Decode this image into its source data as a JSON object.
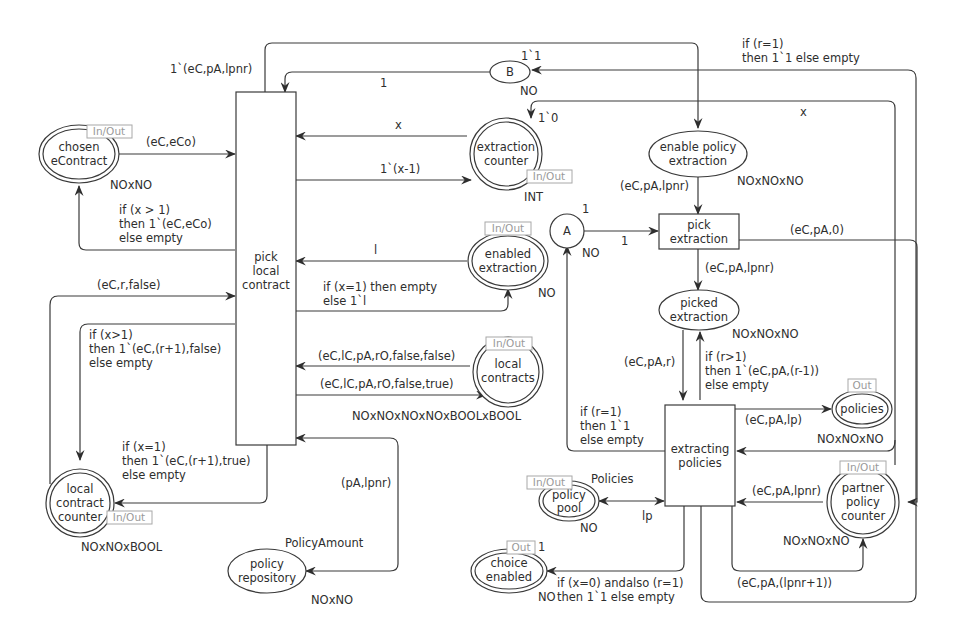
{
  "places": {
    "chosen_econtract": {
      "label1": "chosen",
      "label2": "eContract",
      "port": "In/Out",
      "type": "NOxNO"
    },
    "extraction_counter": {
      "label1": "extraction",
      "label2": "counter",
      "port": "In/Out",
      "type": "INT",
      "init": "1`0"
    },
    "enabled_extraction": {
      "label1": "enabled",
      "label2": "extraction",
      "port": "In/Out",
      "type": "NO"
    },
    "local_contracts": {
      "label1": "local",
      "label2": "contracts",
      "port": "In/Out",
      "type": "NOxNOxNOxNOxBOOLxBOOL"
    },
    "local_contract_counter": {
      "label1": "local",
      "label2": "contract",
      "label3": "counter",
      "port": "In/Out",
      "type": "NOxNOxBOOL"
    },
    "policy_repository": {
      "label1": "policy",
      "label2": "repository",
      "fusion": "PolicyAmount",
      "type": "NOxNO"
    },
    "b": {
      "label": "B",
      "type": "NO",
      "init": "1`1"
    },
    "a": {
      "label": "A",
      "type": "NO",
      "init": "1"
    },
    "enable_policy_extraction": {
      "label1": "enable policy",
      "label2": "extraction",
      "type": "NOxNOxNO"
    },
    "picked_extraction": {
      "label1": "picked",
      "label2": "extraction",
      "type": "NOxNOxNO"
    },
    "policies": {
      "label": "policies",
      "port": "Out",
      "type": "NOxNOxNO"
    },
    "policy_pool": {
      "label1": "policy",
      "label2": "pool",
      "port": "In/Out",
      "fusion": "Policies",
      "type": "NO"
    },
    "partner_policy_counter": {
      "label1": "partner",
      "label2": "policy",
      "label3": "counter",
      "port": "In/Out",
      "type": "NOxNOxNO"
    },
    "choice_enabled": {
      "label1": "choice",
      "label2": "enabled",
      "port": "Out",
      "type": "NO",
      "init": "1"
    }
  },
  "transitions": {
    "pick_local_contract": {
      "label1": "pick",
      "label2": "local",
      "label3": "contract"
    },
    "pick_extraction": {
      "label1": "pick",
      "label2": "extraction"
    },
    "extracting_policies": {
      "label1": "extracting",
      "label2": "policies"
    }
  },
  "arcs": {
    "top_out": "1`(eC,pA,lpnr)",
    "b_to_pick": "1",
    "chosen_to_pick": "(eC,eCo)",
    "pick_to_chosen": [
      "if (x > 1)",
      "then 1`(eC,eCo)",
      "else empty"
    ],
    "counter_to_pick": "x",
    "pick_to_counter": "1`(x-1)",
    "enabled_to_pick": "l",
    "pick_to_enabled": [
      "if (x=1) then empty",
      "else 1`l"
    ],
    "lcc_to_pick": "(eC,r,false)",
    "pick_to_lcc_false": [
      "if (x>1)",
      "then 1`(eC,(r+1),false)",
      "else empty"
    ],
    "lc_to_pick": "(eC,lC,pA,rO,false,false)",
    "pick_to_lc": "(eC,lC,pA,rO,false,true)",
    "pick_to_lcc_true": [
      "if (x=1)",
      "then 1`(eC,(r+1),true)",
      "else empty"
    ],
    "repo_pick": "(pA,lpnr)",
    "to_b": [
      "if (r=1)",
      "then 1`1 else empty"
    ],
    "to_counter_x": "x",
    "epe_to_pickext": "(eC,pA,lpnr)",
    "a_to_pickext": "1",
    "pickext_to_picked": "(eC,pA,lpnr)",
    "pickext_to_ppc": "(eC,pA,0)",
    "picked_to_ext": "(eC,pA,r)",
    "ext_to_picked": [
      "if (r>1)",
      "then 1`(eC,pA,(r-1))",
      "else empty"
    ],
    "ext_to_a": [
      "if (r=1)",
      "then 1`1",
      "else empty"
    ],
    "ext_to_policies": "(eC,pA,lp)",
    "pool_ext": "lp",
    "ppc_to_ext": "(eC,pA,lpnr)",
    "ext_to_ppc": "(eC,pA,(lpnr+1))",
    "ext_to_choice": [
      "if (x=0) andalso (r=1)",
      "then 1`1 else empty"
    ]
  }
}
